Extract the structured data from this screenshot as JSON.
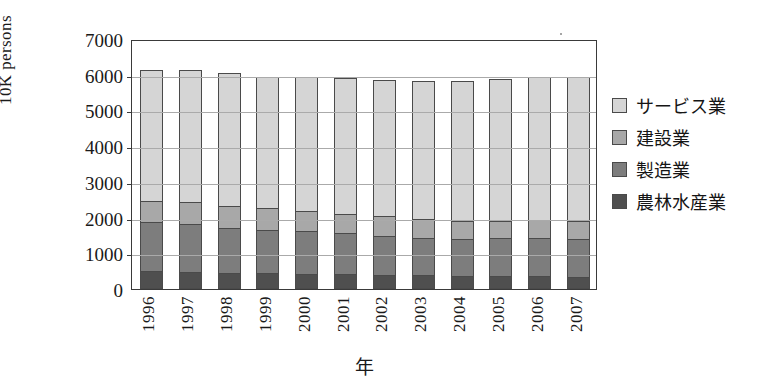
{
  "axes": {
    "y_title": "10K persons",
    "x_title": "年",
    "y_ticks": [
      "0",
      "1000",
      "2000",
      "3000",
      "4000",
      "5000",
      "6000",
      "7000"
    ],
    "x_ticks": [
      "1996",
      "1997",
      "1998",
      "1999",
      "2000",
      "2001",
      "2002",
      "2003",
      "2004",
      "2005",
      "2006",
      "2007"
    ]
  },
  "legend": {
    "items": [
      {
        "label": "サービス業",
        "color": "#d5d5d5"
      },
      {
        "label": "建設業",
        "color": "#a8a8a8"
      },
      {
        "label": "製造業",
        "color": "#7d7d7d"
      },
      {
        "label": "農林水産業",
        "color": "#4f4f4f"
      }
    ]
  },
  "chart_data": {
    "type": "bar",
    "stacked": true,
    "title": "",
    "xlabel": "年",
    "ylabel": "10K persons",
    "ylim": [
      0,
      7000
    ],
    "ytick_step": 1000,
    "grid": true,
    "legend_position": "right",
    "categories": [
      "1996",
      "1997",
      "1998",
      "1999",
      "2000",
      "2001",
      "2002",
      "2003",
      "2004",
      "2005",
      "2006",
      "2007"
    ],
    "series": [
      {
        "name": "農林水産業",
        "color": "#4f4f4f",
        "values": [
          500,
          490,
          440,
          450,
          420,
          410,
          390,
          390,
          370,
          360,
          360,
          350
        ]
      },
      {
        "name": "製造業",
        "color": "#7d7d7d",
        "values": [
          1400,
          1360,
          1310,
          1250,
          1250,
          1190,
          1120,
          1080,
          1080,
          1100,
          1100,
          1100
        ]
      },
      {
        "name": "建設業",
        "color": "#a8a8a8",
        "values": [
          650,
          660,
          640,
          650,
          600,
          560,
          600,
          570,
          530,
          530,
          540,
          540
        ]
      },
      {
        "name": "サービス業",
        "color": "#d5d5d5",
        "values": [
          3700,
          3740,
          3770,
          3700,
          3780,
          3860,
          3840,
          3900,
          3960,
          4010,
          4040,
          4060
        ]
      }
    ],
    "totals": [
      6250,
      6250,
      6160,
      6050,
      6050,
      6020,
      5950,
      5940,
      5940,
      6000,
      6040,
      6050
    ]
  }
}
